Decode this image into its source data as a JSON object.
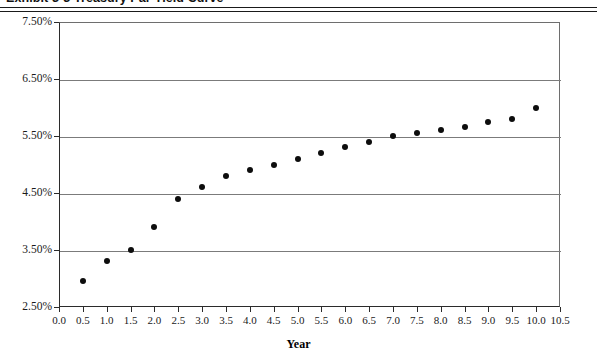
{
  "title": "Exhibit 3-3 Treasury Par Yield Curve",
  "axis": {
    "x_title": "Year",
    "y_ticks": [
      "2.50%",
      "3.50%",
      "4.50%",
      "5.50%",
      "6.50%",
      "7.50%"
    ],
    "x_ticks": [
      "0.0",
      "0.5",
      "1.0",
      "1.5",
      "2.0",
      "2.5",
      "3.0",
      "3.5",
      "4.0",
      "4.5",
      "5.0",
      "5.5",
      "6.0",
      "6.5",
      "7.0",
      "7.5",
      "8.0",
      "8.5",
      "9.0",
      "9.5",
      "10.0",
      "10.5"
    ]
  },
  "chart_data": {
    "type": "scatter",
    "title": "Exhibit 3-3 Treasury Par Yield Curve",
    "xlabel": "Year",
    "ylabel": "",
    "xlim": [
      0.0,
      10.5
    ],
    "ylim": [
      2.5,
      7.5
    ],
    "ytick_values": [
      2.5,
      3.5,
      4.5,
      5.5,
      6.5,
      7.5
    ],
    "ytick_labels": [
      "2.50%",
      "3.50%",
      "4.50%",
      "5.50%",
      "6.50%",
      "7.50%"
    ],
    "xtick_values": [
      0.0,
      0.5,
      1.0,
      1.5,
      2.0,
      2.5,
      3.0,
      3.5,
      4.0,
      4.5,
      5.0,
      5.5,
      6.0,
      6.5,
      7.0,
      7.5,
      8.0,
      8.5,
      9.0,
      9.5,
      10.0,
      10.5
    ],
    "grid": "horizontal",
    "legend": null,
    "marker": "filled-circle",
    "marker_color": "#0d0d0d",
    "x": [
      0.5,
      1.0,
      1.5,
      2.0,
      2.5,
      3.0,
      3.5,
      4.0,
      4.5,
      5.0,
      5.5,
      6.0,
      6.5,
      7.0,
      7.5,
      8.0,
      8.5,
      9.0,
      9.5,
      10.0
    ],
    "y": [
      2.95,
      3.3,
      3.5,
      3.9,
      4.4,
      4.6,
      4.8,
      4.9,
      5.0,
      5.1,
      5.2,
      5.3,
      5.4,
      5.5,
      5.55,
      5.6,
      5.65,
      5.75,
      5.8,
      6.0
    ],
    "series": [
      {
        "name": "Treasury Par Yield",
        "points": [
          {
            "year": 0.5,
            "yield": 2.95
          },
          {
            "year": 1.0,
            "yield": 3.3
          },
          {
            "year": 1.5,
            "yield": 3.5
          },
          {
            "year": 2.0,
            "yield": 3.9
          },
          {
            "year": 2.5,
            "yield": 4.4
          },
          {
            "year": 3.0,
            "yield": 4.6
          },
          {
            "year": 3.5,
            "yield": 4.8
          },
          {
            "year": 4.0,
            "yield": 4.9
          },
          {
            "year": 4.5,
            "yield": 5.0
          },
          {
            "year": 5.0,
            "yield": 5.1
          },
          {
            "year": 5.5,
            "yield": 5.2
          },
          {
            "year": 6.0,
            "yield": 5.3
          },
          {
            "year": 6.5,
            "yield": 5.4
          },
          {
            "year": 7.0,
            "yield": 5.5
          },
          {
            "year": 7.5,
            "yield": 5.55
          },
          {
            "year": 8.0,
            "yield": 5.6
          },
          {
            "year": 8.5,
            "yield": 5.65
          },
          {
            "year": 9.0,
            "yield": 5.75
          },
          {
            "year": 9.5,
            "yield": 5.8
          },
          {
            "year": 10.0,
            "yield": 6.0
          }
        ]
      }
    ]
  }
}
